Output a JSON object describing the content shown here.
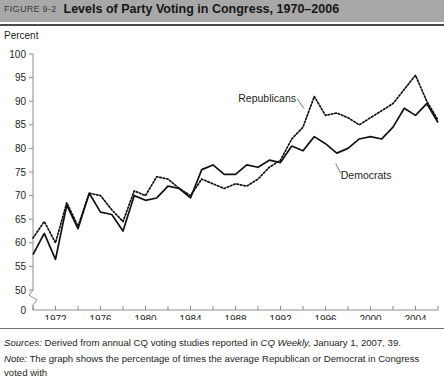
{
  "header": {
    "figure_number": "FIGURE 9-2",
    "title": "Levels of Party Voting in Congress, 1970–2006",
    "bar_color": "#a8a8a8"
  },
  "footer": {
    "sources_label": "Sources:",
    "sources_text_a": " Derived from annual CQ voting studies reported in ",
    "sources_italic": "CQ Weekly,",
    "sources_text_b": " January 1, 2007, 39.",
    "note_label": "Note:",
    "note_text": " The graph shows the percentage of times the average Republican or Democrat in Congress voted with"
  },
  "chart_data": {
    "type": "line",
    "title": "Levels of Party Voting in Congress, 1970–2006",
    "xlabel": "",
    "ylabel": "Percent",
    "ylabel_position": "top-left",
    "ylim": [
      50,
      100
    ],
    "y_axis_break": true,
    "y_zero_label": "0",
    "yticks": [
      50,
      55,
      60,
      65,
      70,
      75,
      80,
      85,
      90,
      95,
      100
    ],
    "ytick_labels": [
      "50",
      "55",
      "60",
      "65",
      "70",
      "75",
      "80",
      "85",
      "90",
      "95",
      "100"
    ],
    "xlim": [
      1970,
      2006
    ],
    "xticks": [
      1970,
      1972,
      1974,
      1976,
      1978,
      1980,
      1982,
      1984,
      1986,
      1988,
      1990,
      1992,
      1994,
      1996,
      1998,
      2000,
      2002,
      2004,
      2006
    ],
    "xtick_labels_shown": [
      "1972",
      "1976",
      "1980",
      "1984",
      "1988",
      "1992",
      "1996",
      "2000",
      "2004"
    ],
    "grid": false,
    "legend_position": "inline-annotation",
    "annotations": [
      {
        "text": "Republicans",
        "series": "Republicans",
        "x": 1994,
        "y": 88
      },
      {
        "text": "Democrats",
        "series": "Democrats",
        "x": 1997,
        "y": 77
      }
    ],
    "x": [
      1970,
      1971,
      1972,
      1973,
      1974,
      1975,
      1976,
      1977,
      1978,
      1979,
      1980,
      1981,
      1982,
      1983,
      1984,
      1985,
      1986,
      1987,
      1988,
      1989,
      1990,
      1991,
      1992,
      1993,
      1994,
      1995,
      1996,
      1997,
      1998,
      1999,
      2000,
      2001,
      2002,
      2003,
      2004,
      2005,
      2006
    ],
    "series": [
      {
        "name": "Democrats",
        "style": "solid",
        "color": "#111111",
        "values": [
          57.5,
          62.0,
          56.5,
          68.0,
          63.0,
          70.5,
          66.5,
          66.0,
          62.5,
          70.0,
          69.0,
          69.5,
          72.0,
          71.5,
          69.5,
          75.5,
          76.5,
          74.5,
          74.5,
          76.5,
          76.0,
          77.5,
          77.0,
          80.5,
          79.5,
          82.5,
          81.0,
          79.0,
          80.0,
          82.0,
          82.5,
          82.0,
          84.5,
          88.5,
          87.0,
          89.5,
          85.5
        ]
      },
      {
        "name": "Republicans",
        "style": "dotted",
        "color": "#111111",
        "values": [
          61.0,
          64.5,
          60.0,
          68.5,
          63.5,
          70.5,
          70.0,
          67.0,
          64.5,
          71.0,
          70.0,
          74.0,
          73.5,
          71.5,
          70.0,
          73.5,
          72.5,
          71.5,
          72.5,
          72.0,
          73.5,
          76.0,
          77.5,
          82.0,
          84.5,
          91.0,
          87.0,
          87.5,
          86.5,
          85.0,
          86.5,
          88.0,
          89.5,
          92.5,
          95.5,
          90.0,
          86.0
        ]
      }
    ]
  }
}
